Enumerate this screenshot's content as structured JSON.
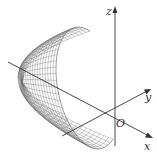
{
  "figure": {
    "type": "3d-surface-plot",
    "axes": {
      "x": {
        "label": "x"
      },
      "y": {
        "label": "y"
      },
      "z": {
        "label": "z"
      },
      "origin": {
        "label": "O"
      }
    },
    "colors": {
      "axis": "#333333",
      "mesh": "#6a6a6a",
      "background": "#ffffff"
    }
  }
}
